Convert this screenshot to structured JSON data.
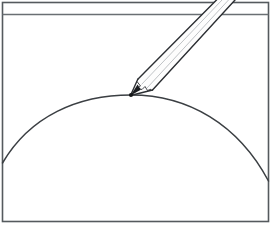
{
  "figure": {
    "description": "Line drawing: a rectangular frame with a thin horizontal band across the top; a large circular arc forms a dome inside the frame; a sharpened pencil points down from the upper right and its tip touches the apex of the arc.",
    "canvas": {
      "width": 271,
      "height": 226,
      "background": "#ffffff"
    }
  },
  "colors": {
    "frame_stroke": "#555a5e",
    "band_stroke": "#6a6f73",
    "arc_stroke": "#3b3f43",
    "pencil_outline": "#2c2f33",
    "pencil_inner_line": "#b9bcc0",
    "pencil_body_fill": "#fdfdfd",
    "pencil_facet_fill": "#f4f5f6",
    "tip_graphite": "#1a1c1f",
    "contact_point": "#16181a"
  },
  "frame": {
    "name": "outer-border",
    "x": 2.5,
    "y": 2.5,
    "width": 266,
    "height": 219,
    "stroke_width": 1.6
  },
  "header_band": {
    "name": "top-divider-line",
    "y": 14.5,
    "x1": 2.5,
    "x2": 268.5,
    "stroke_width": 1.4
  },
  "arc": {
    "name": "dome-arc",
    "type": "circular-arc",
    "left_endpoint": {
      "x": 2.5,
      "y": 163
    },
    "apex": {
      "x": 131,
      "y": 95
    },
    "right_endpoint": {
      "x": 268.5,
      "y": 181
    },
    "stroke_width": 1.5,
    "path": "M 2.5 163 C 30 116 78 95 131 95 C 188 95 238 124 268.5 181"
  },
  "contact_point": {
    "name": "tangent-contact-point",
    "x": 131,
    "y": 95,
    "radius": 2.1
  },
  "pencil": {
    "name": "pencil",
    "angle_description": "points down-left at roughly 40 degrees below horizontal",
    "tip": {
      "x": 130.5,
      "y": 95.5
    },
    "exits_canvas_at_top": true,
    "shaft_left_edge": "M 137.8 79.2 L 216.5 0",
    "shaft_right_edge": "M 152.5 90.0 L 235.0 0",
    "cone_left_edge": "M 130.5 95.5 L 137.8 79.2",
    "cone_right_edge": "M 130.5 95.5 L 152.5 90.0",
    "inner_line_1": "M 141.5 84.5 L 222.0 0",
    "inner_line_2": "M 147.0 88.0 L 228.5 0",
    "wood_graphite_boundary": "M 137.0 81.5 L 140.5 86.0 L 137.5 88.2 L 142.0 89.5 L 145.0 86.5 L 147.5 90.5 L 151.0 89.2",
    "graphite_tip": "M 130.5 95.5 L 137.6 84.6 L 140.8 89.8 Z",
    "stroke_width": 1.4,
    "inner_stroke_width": 0.9
  }
}
